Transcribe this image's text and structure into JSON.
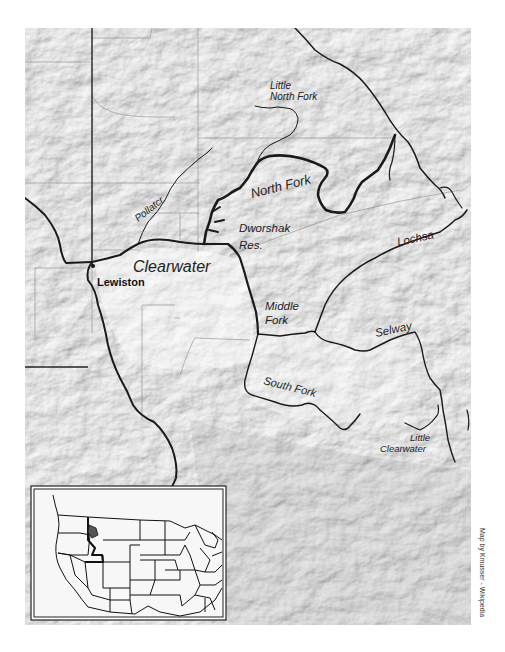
{
  "map": {
    "title": "Clearwater River basin",
    "labels": {
      "little_north_fork_line1": "Little",
      "little_north_fork_line2": "North Fork",
      "north_fork": "North Fork",
      "potlatch": "Pollatcr.",
      "dworshak_line1": "Dworshak",
      "dworshak_line2": "Res.",
      "clearwater": "Clearwater",
      "lewiston": "Lewiston",
      "lochsa": "Lochsa",
      "middle_fork_line1": "Middle",
      "middle_fork_line2": "Fork",
      "selway": "Selway",
      "south_fork": "South Fork",
      "little_clearwater_line1": "Little",
      "little_clearwater_line2": "Clearwater"
    },
    "inset": {
      "description": "Locator map of the contiguous United States with Clearwater basin highlighted"
    },
    "credit": "Map by Kmusser - Wikipedia",
    "colors": {
      "relief_light": "#f2f2f2",
      "relief_mid": "#d8d8d8",
      "relief_dark": "#b8b8b8",
      "river": "#1a1a1a",
      "boundary": "#8a8a8a",
      "state_line": "#222222"
    }
  }
}
